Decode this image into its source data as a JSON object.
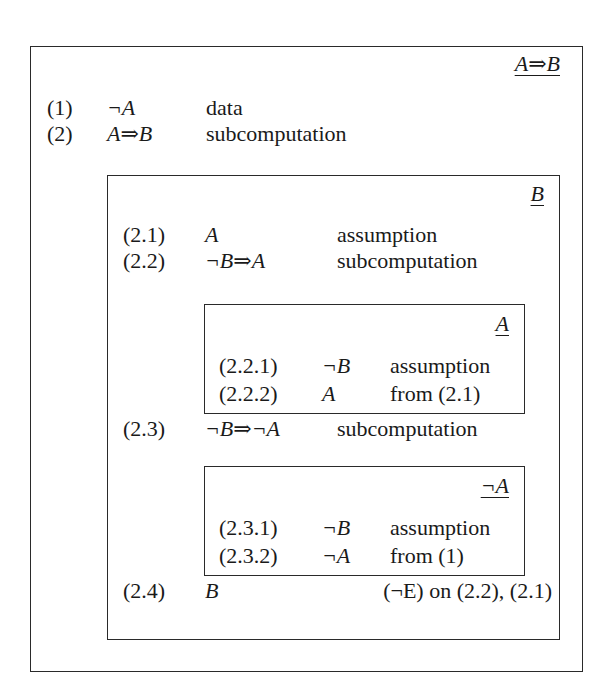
{
  "outer": {
    "goal": "A⇒B",
    "rows": [
      {
        "num": "(1)",
        "formula": "¬A",
        "just": "data"
      },
      {
        "num": "(2)",
        "formula": "A⇒B",
        "just": "subcomputation"
      }
    ]
  },
  "middle": {
    "goal": "B",
    "rows": [
      {
        "num": "(2.1)",
        "formula": "A",
        "just": "assumption"
      },
      {
        "num": "(2.2)",
        "formula": "¬B⇒A",
        "just": "subcomputation"
      },
      {
        "num": "(2.3)",
        "formula": "¬B⇒¬A",
        "just": "subcomputation"
      },
      {
        "num": "(2.4)",
        "formula": "B",
        "just": "(¬E) on (2.2), (2.1)"
      }
    ]
  },
  "inner1": {
    "goal": "A",
    "rows": [
      {
        "num": "(2.2.1)",
        "formula": "¬B",
        "just": "assumption"
      },
      {
        "num": "(2.2.2)",
        "formula": "A",
        "just": "from (2.1)"
      }
    ]
  },
  "inner2": {
    "goal": "¬A",
    "rows": [
      {
        "num": "(2.3.1)",
        "formula": "¬B",
        "just": "assumption"
      },
      {
        "num": "(2.3.2)",
        "formula": "¬A",
        "just": "from (1)"
      }
    ]
  }
}
